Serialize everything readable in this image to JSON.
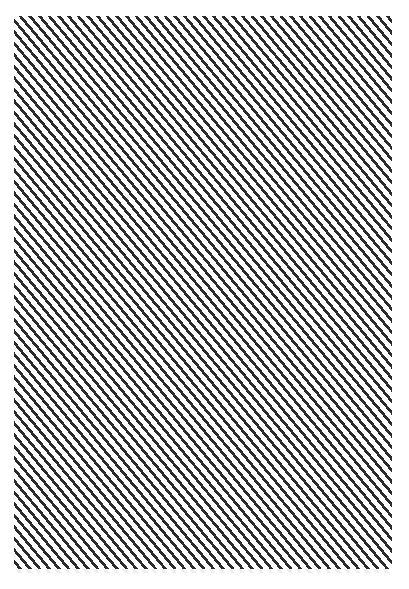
{
  "image": {
    "description": "Diagonal stripe pattern",
    "pattern": {
      "type": "diagonal-stripes",
      "direction": "top-left to bottom-right",
      "stripe_color": "#2b2b2b",
      "background_color": "#ffffff",
      "horizontal_period_px": 10
    }
  }
}
